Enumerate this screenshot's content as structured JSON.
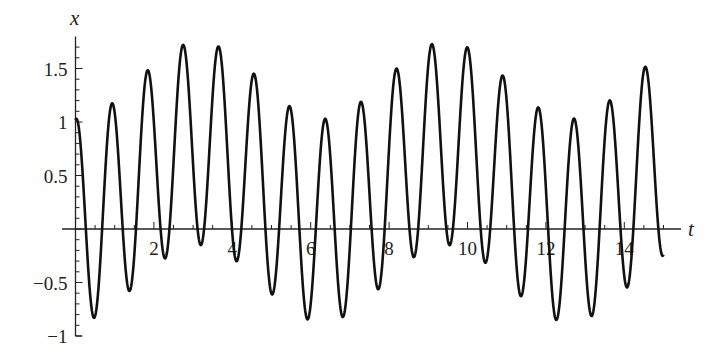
{
  "chart_data": {
    "type": "line",
    "title": "",
    "xlabel": "t",
    "ylabel": "x",
    "xlim": [
      0,
      15
    ],
    "ylim": [
      -1,
      1.8
    ],
    "grid": false,
    "legend": null,
    "x_ticks": [
      2,
      4,
      6,
      8,
      10,
      12,
      14
    ],
    "x_tick_labels": [
      "2",
      "4",
      "6",
      "8",
      "10",
      "12",
      "14"
    ],
    "y_ticks": [
      -1,
      -0.5,
      0.5,
      1,
      1.5
    ],
    "y_tick_labels": [
      "−1",
      "−0.5",
      "0.5",
      "1",
      "1.5"
    ],
    "model": {
      "description": "x(t) ≈ c0 - c1*cos(2πt/Tb) + A*cos(ω(t - t0))",
      "c0": 0.44,
      "c1": 0.36,
      "Tb": 6.3,
      "A": 0.95,
      "omega": 6.93,
      "t0": 0.93
    },
    "peaks": [
      {
        "t": 0.93,
        "x": 1.42
      },
      {
        "t": 1.83,
        "x": 1.67
      },
      {
        "t": 2.74,
        "x": 1.78
      },
      {
        "t": 3.64,
        "x": 1.77
      },
      {
        "t": 4.53,
        "x": 1.65
      },
      {
        "t": 5.42,
        "x": 1.4
      },
      {
        "t": 6.36,
        "x": 1.0
      },
      {
        "t": 7.28,
        "x": 1.43
      },
      {
        "t": 8.2,
        "x": 1.69
      },
      {
        "t": 9.09,
        "x": 1.79
      },
      {
        "t": 9.99,
        "x": 1.76
      },
      {
        "t": 10.9,
        "x": 1.62
      },
      {
        "t": 11.82,
        "x": 1.36
      },
      {
        "t": 12.74,
        "x": 1.0
      },
      {
        "t": 13.66,
        "x": 1.43
      },
      {
        "t": 14.55,
        "x": 1.7
      }
    ],
    "troughs": [
      {
        "t": 0.42,
        "x": -0.79
      },
      {
        "t": 1.34,
        "x": -0.45
      },
      {
        "t": 2.26,
        "x": -0.2
      },
      {
        "t": 3.18,
        "x": -0.15
      },
      {
        "t": 4.09,
        "x": -0.22
      },
      {
        "t": 4.99,
        "x": -0.45
      },
      {
        "t": 5.9,
        "x": -0.84
      },
      {
        "t": 6.82,
        "x": -0.75
      },
      {
        "t": 7.74,
        "x": -0.43
      },
      {
        "t": 8.64,
        "x": -0.2
      },
      {
        "t": 9.55,
        "x": -0.15
      },
      {
        "t": 10.46,
        "x": -0.22
      },
      {
        "t": 11.36,
        "x": -0.47
      },
      {
        "t": 12.28,
        "x": -0.88
      },
      {
        "t": 13.2,
        "x": -0.73
      },
      {
        "t": 14.12,
        "x": -0.42
      }
    ],
    "start": {
      "t": 0,
      "x": 1.0
    },
    "end": {
      "t": 15,
      "x": -0.2
    }
  },
  "layout": {
    "x0_px": 75.5,
    "px_per_t": 39.2,
    "y0_px": 229,
    "px_per_x": 107,
    "line_color": "#111111"
  }
}
